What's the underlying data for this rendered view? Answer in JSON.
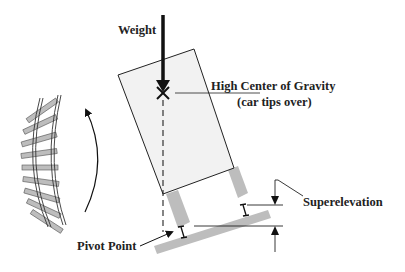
{
  "labels": {
    "weight": "Weight",
    "cog_line1": "High Center of Gravity",
    "cog_line2": "(car tips over)",
    "superelevation": "Superelevation",
    "pivot": "Pivot Point"
  },
  "colors": {
    "car_fill": "#f2f2f2",
    "outline": "#222222",
    "gray_part": "#bdbdbd",
    "background": "#ffffff"
  }
}
